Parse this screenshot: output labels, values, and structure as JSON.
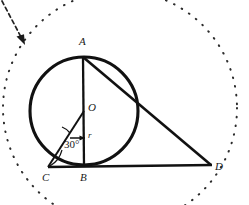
{
  "figure": {
    "type": "geometry-diagram",
    "stroke_color": "#111111",
    "dotted_color": "#2b2b2b",
    "background": "#ffffff",
    "canvas": {
      "width": 249,
      "height": 205
    }
  },
  "labels": {
    "point_a": "A",
    "point_b": "B",
    "point_c": "C",
    "point_d": "D",
    "center_o": "O",
    "radius_r": "r",
    "angle_30": "30°"
  },
  "geometry": {
    "circle": {
      "cx": 84,
      "cy": 111,
      "r": 54
    },
    "outer_dotted_circle": {
      "cx": 120,
      "cy": 108,
      "r": 117
    },
    "points": {
      "A": {
        "x": 83,
        "y": 57
      },
      "B": {
        "x": 84,
        "y": 165
      },
      "C": {
        "x": 50,
        "y": 167
      },
      "D": {
        "x": 211,
        "y": 165
      },
      "O": {
        "x": 84,
        "y": 111
      },
      "T": {
        "x": 47,
        "y": 138
      }
    },
    "angle_marker": {
      "vertex": "O",
      "value_degrees": 30,
      "from": "horizontal-right",
      "to": "OT"
    }
  },
  "annotation": {
    "arrow": {
      "from_x": 2,
      "from_y": 2,
      "to_x": 25,
      "to_y": 45,
      "style": "dashed",
      "head": "filled"
    }
  }
}
